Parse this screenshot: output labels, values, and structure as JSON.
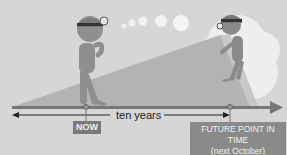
{
  "diagram": {
    "labels": {
      "now": "NOW",
      "span": "ten years",
      "future_line1": "FUTURE POINT IN TIME",
      "future_line2": "(next October)"
    },
    "colors": {
      "background": "#d6d6d6",
      "timeline": "#7a7a7a",
      "wedge": "#b8b8b8",
      "figure": "#8f8f8f",
      "cloud": "#efefef",
      "label_box": "#7a7a7a"
    }
  }
}
